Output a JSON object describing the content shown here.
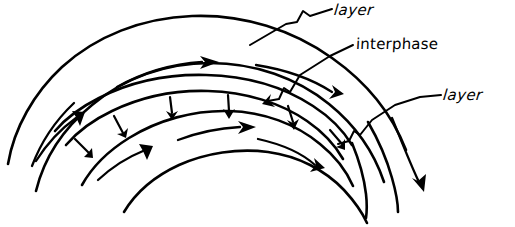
{
  "diagram": {
    "style": "hand-drawn sketch",
    "stroke_color": "#000000",
    "background_color": "#ffffff",
    "labels": [
      {
        "id": "layer_top",
        "text": "layer",
        "points_to": "outer-layer-band"
      },
      {
        "id": "interphase",
        "text": "interphase",
        "points_to": "interphase-band"
      },
      {
        "id": "layer_right",
        "text": "layer",
        "points_to": "inner-layer-band"
      }
    ],
    "regions": [
      {
        "name": "outer-layer",
        "label": "layer"
      },
      {
        "name": "interphase",
        "label": "interphase"
      },
      {
        "name": "inner-layer",
        "label": "layer"
      }
    ],
    "flow_arrows": {
      "count": 7,
      "description": "tangential arrows following the arcs",
      "direction": "clockwise along arcs"
    },
    "crossing_arrows": {
      "count": 5,
      "description": "short arrows crossing the interphase band",
      "direction": "inward, perpendicular to band"
    }
  }
}
